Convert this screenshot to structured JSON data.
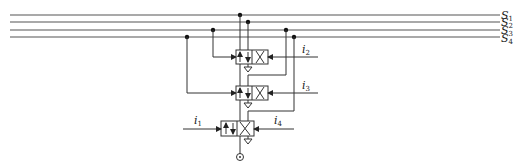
{
  "diagram": {
    "type": "pneumatic-logic-schematic",
    "bus_lines": [
      {
        "name": "S",
        "sub": "1",
        "y": 15
      },
      {
        "name": "S",
        "sub": "2",
        "y": 22
      },
      {
        "name": "S",
        "sub": "3",
        "y": 30
      },
      {
        "name": "S",
        "sub": "4",
        "y": 37
      }
    ],
    "inputs": [
      {
        "name": "i",
        "sub": "1"
      },
      {
        "name": "i",
        "sub": "2"
      },
      {
        "name": "i",
        "sub": "3"
      },
      {
        "name": "i",
        "sub": "4"
      }
    ],
    "valves": [
      {
        "id": "valve-1",
        "type": "3/2 directional valve"
      },
      {
        "id": "valve-2",
        "type": "3/2 directional valve"
      },
      {
        "id": "valve-3",
        "type": "3/2 directional valve"
      }
    ],
    "output": {
      "symbol": "output-port"
    }
  }
}
